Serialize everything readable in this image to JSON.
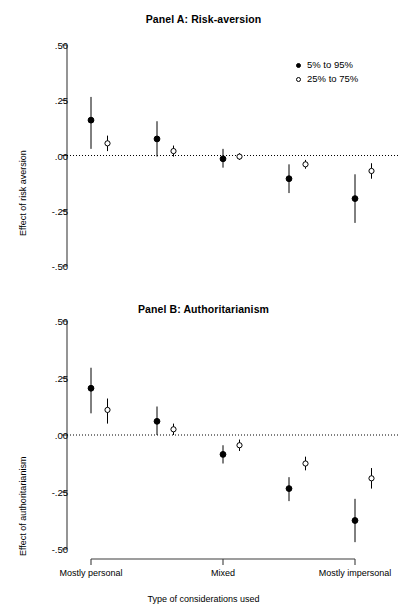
{
  "figure": {
    "width": 407,
    "height": 610,
    "background": "#ffffff",
    "axis_color": "#3d3d3d",
    "marker_color": "#000000"
  },
  "xaxis": {
    "title": "Type of considerations used",
    "tick_labels": [
      "Mostly personal",
      "Mixed",
      "Mostly impersonal"
    ]
  },
  "legend": {
    "items": [
      {
        "label": "5% to 95%",
        "marker": "filled-circle"
      },
      {
        "label": "25% to 75%",
        "marker": "open-circle"
      }
    ]
  },
  "chart_data": [
    {
      "type": "scatter",
      "title": "Panel A: Risk-aversion",
      "xlabel": "Type of considerations used",
      "ylabel": "Effect of risk aversion",
      "ylim": [
        -0.5,
        0.5
      ],
      "ytick_labels": [
        ".50",
        ".25",
        ".00",
        "-.25",
        "-.50"
      ],
      "ytick_values": [
        0.5,
        0.25,
        0.0,
        -0.25,
        -0.5
      ],
      "grid": false,
      "zero_reference_line": 0.0,
      "categories": [
        "Mostly personal",
        "",
        "Mixed",
        "",
        "Mostly impersonal"
      ],
      "series": [
        {
          "name": "5% to 95%",
          "marker": "filled-circle",
          "x": [
            1,
            2,
            3,
            4,
            5
          ],
          "values": [
            0.16,
            0.075,
            -0.015,
            -0.105,
            -0.195
          ],
          "lower": [
            0.03,
            -0.005,
            -0.055,
            -0.17,
            -0.305
          ],
          "upper": [
            0.265,
            0.155,
            0.03,
            -0.04,
            -0.085
          ]
        },
        {
          "name": "25% to 75%",
          "marker": "open-circle",
          "x": [
            1.25,
            2.25,
            3.25,
            4.25,
            5.25
          ],
          "values": [
            0.055,
            0.02,
            -0.005,
            -0.04,
            -0.07
          ],
          "lower": [
            0.02,
            -0.005,
            -0.02,
            -0.06,
            -0.105
          ],
          "upper": [
            0.09,
            0.045,
            0.01,
            -0.02,
            -0.035
          ]
        }
      ]
    },
    {
      "type": "scatter",
      "title": "Panel B: Authoritarianism",
      "xlabel": "Type of considerations used",
      "ylabel": "Effect of authoritarianism",
      "ylim": [
        -0.5,
        0.5
      ],
      "ytick_labels": [
        ".50",
        ".25",
        ".00",
        "-.25",
        "-.50"
      ],
      "ytick_values": [
        0.5,
        0.25,
        0.0,
        -0.25,
        -0.5
      ],
      "grid": false,
      "zero_reference_line": 0.0,
      "categories": [
        "Mostly personal",
        "",
        "Mixed",
        "",
        "Mostly impersonal"
      ],
      "series": [
        {
          "name": "5% to 95%",
          "marker": "filled-circle",
          "x": [
            1,
            2,
            3,
            4,
            5
          ],
          "values": [
            0.205,
            0.06,
            -0.085,
            -0.235,
            -0.375
          ],
          "lower": [
            0.095,
            0.0,
            -0.125,
            -0.29,
            -0.47
          ],
          "upper": [
            0.295,
            0.125,
            -0.045,
            -0.185,
            -0.28
          ]
        },
        {
          "name": "25% to 75%",
          "marker": "open-circle",
          "x": [
            1.25,
            2.25,
            3.25,
            4.25,
            5.25
          ],
          "values": [
            0.11,
            0.025,
            -0.045,
            -0.125,
            -0.19
          ],
          "lower": [
            0.05,
            0.0,
            -0.07,
            -0.155,
            -0.235
          ],
          "upper": [
            0.16,
            0.05,
            -0.02,
            -0.095,
            -0.145
          ]
        }
      ]
    }
  ]
}
